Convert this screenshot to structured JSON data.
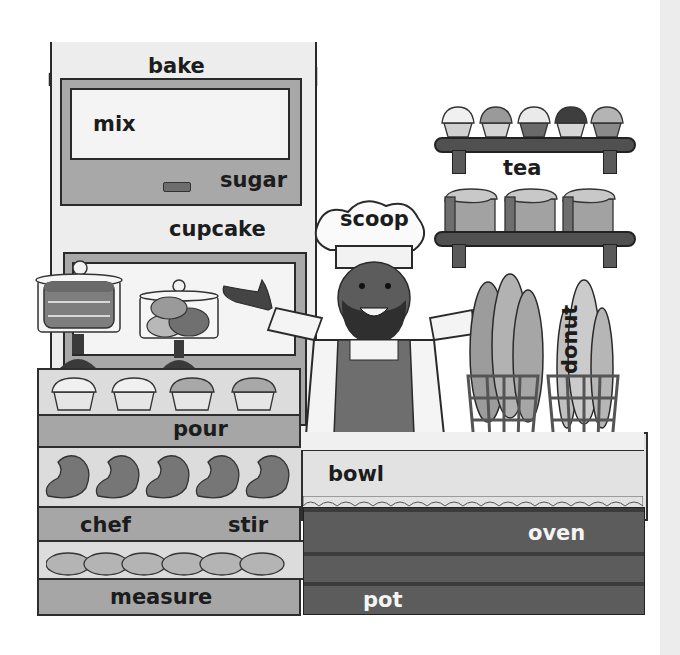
{
  "scene": {
    "title": "Bakery word-finding scene",
    "palette": {
      "background": "#ffffff",
      "side_panel": "#ececec",
      "outline": "#2a2a2a",
      "light_fill": "#ededed",
      "mid_gray": "#a8a8a8",
      "dark_counter": "#5c5c5c",
      "word_dark": "#1c1c1c",
      "word_light": "#f4f4f4"
    }
  },
  "words": {
    "bake": "bake",
    "mix": "mix",
    "sugar": "sugar",
    "cupcake": "cupcake",
    "scoop": "scoop",
    "tea": "tea",
    "donut": "donut",
    "pour": "pour",
    "bowl": "bowl",
    "chef": "chef",
    "stir": "stir",
    "oven": "oven",
    "measure": "measure",
    "pot": "pot"
  },
  "objects": {
    "top_shelf_items": [
      "cupcake",
      "cupcake",
      "cupcake",
      "cupcake",
      "cupcake"
    ],
    "bottom_shelf_items": [
      "bread loaf",
      "bread loaf",
      "bread loaf"
    ],
    "display_case_rows": [
      {
        "items": [
          "cupcake",
          "cupcake",
          "cupcake",
          "cupcake"
        ],
        "label_words": [
          "pour"
        ]
      },
      {
        "items": [
          "croissant",
          "croissant",
          "croissant",
          "croissant",
          "croissant"
        ],
        "label_words": [
          "chef",
          "stir"
        ]
      },
      {
        "items": [
          "bun",
          "bun",
          "bun",
          "bun",
          "bun",
          "bun"
        ],
        "label_words": [
          "measure"
        ]
      }
    ],
    "cake_stands": [
      "layer cake",
      "macarons"
    ],
    "baskets": [
      "baguettes",
      "baguettes"
    ]
  }
}
